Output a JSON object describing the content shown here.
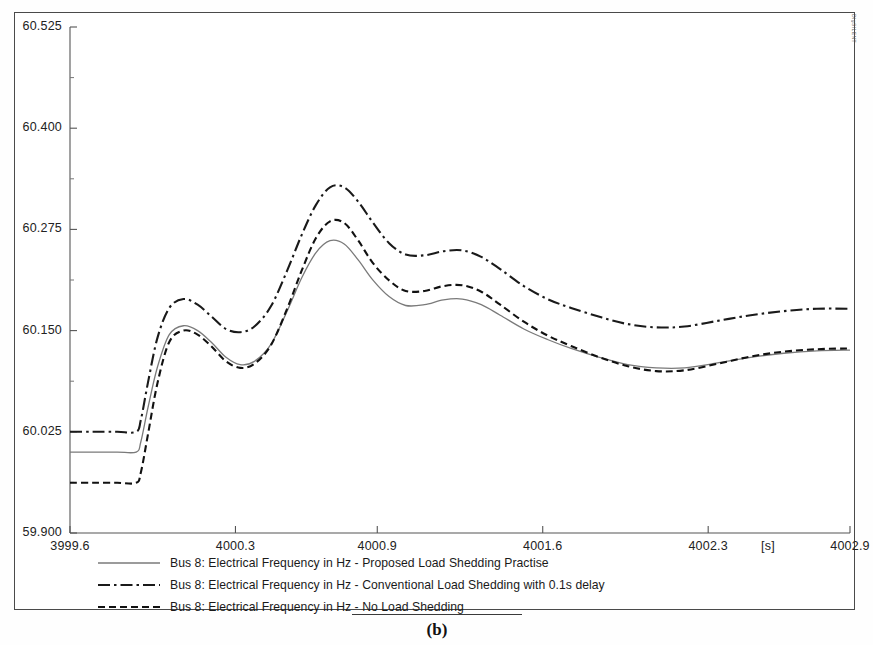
{
  "figure": {
    "caption": "(b)",
    "watermark": "DIgSILENT"
  },
  "axes": {
    "y_ticks": [
      "60.525",
      "60.400",
      "60.275",
      "60.150",
      "60.025",
      "59.900"
    ],
    "x_ticks": [
      "3999.6",
      "4000.3",
      "4000.9",
      "4001.6",
      "4002.3",
      "4002.9"
    ],
    "x_unit": "[s]"
  },
  "legend": [
    {
      "key": "solid-line-key",
      "label": "Bus 8: Electrical Frequency in Hz - Proposed Load Shedding Practise"
    },
    {
      "key": "dash-dot-line-key",
      "label": "Bus 8: Electrical Frequency in Hz - Conventional Load Shedding with 0.1s delay"
    },
    {
      "key": "dashed-line-key",
      "label": "Bus 8: Electrical Frequency in Hz - No Load Shedding"
    }
  ],
  "chart_data": {
    "type": "line",
    "title": "",
    "xlabel": "[s]",
    "ylabel": "Electrical Frequency in Hz",
    "xlim": [
      3999.6,
      4002.9
    ],
    "ylim": [
      59.9,
      60.525
    ],
    "grid": false,
    "legend_position": "below-axes",
    "x": [
      3999.6,
      3999.7,
      3999.8,
      3999.88,
      3999.9,
      3999.93,
      3999.97,
      4000.02,
      4000.08,
      4000.14,
      4000.2,
      4000.26,
      4000.32,
      4000.38,
      4000.45,
      4000.52,
      4000.58,
      4000.64,
      4000.7,
      4000.76,
      4000.82,
      4000.88,
      4000.95,
      4001.02,
      4001.1,
      4001.18,
      4001.26,
      4001.34,
      4001.42,
      4001.52,
      4001.62,
      4001.72,
      4001.84,
      4001.96,
      4002.08,
      4002.2,
      4002.34,
      4002.48,
      4002.62,
      4002.76,
      4002.9
    ],
    "series": [
      {
        "name": "Bus 8: Electrical Frequency in Hz - Proposed Load Shedding Practise",
        "style": "solid",
        "color": "#7a7a7a",
        "values": [
          60.0,
          60.0,
          60.0,
          60.0,
          60.013,
          60.055,
          60.105,
          60.145,
          60.156,
          60.15,
          60.135,
          60.117,
          60.108,
          60.112,
          60.133,
          60.175,
          60.215,
          60.246,
          60.261,
          60.257,
          60.237,
          60.213,
          60.192,
          60.181,
          60.182,
          60.188,
          60.189,
          60.182,
          60.169,
          60.152,
          60.139,
          60.128,
          60.117,
          60.108,
          60.104,
          60.104,
          60.11,
          60.117,
          60.122,
          60.125,
          60.126
        ]
      },
      {
        "name": "Bus 8: Electrical Frequency in Hz - Conventional Load Shedding with 0.1s delay",
        "style": "dash-dot",
        "color": "#1a1a1a",
        "values": [
          60.025,
          60.025,
          60.025,
          60.025,
          60.04,
          60.086,
          60.141,
          60.178,
          60.189,
          60.182,
          60.167,
          60.152,
          60.148,
          60.155,
          60.18,
          60.225,
          60.268,
          60.305,
          60.327,
          60.327,
          60.309,
          60.284,
          60.258,
          60.244,
          60.243,
          60.248,
          60.249,
          60.241,
          60.226,
          60.205,
          60.189,
          60.178,
          60.167,
          60.158,
          60.154,
          60.155,
          60.162,
          60.169,
          60.174,
          60.177,
          60.177
        ]
      },
      {
        "name": "Bus 8: Electrical Frequency in Hz - No Load Shedding",
        "style": "dashed",
        "color": "#111111",
        "values": [
          59.962,
          59.962,
          59.962,
          59.962,
          59.975,
          60.022,
          60.085,
          60.136,
          60.15,
          60.145,
          60.13,
          60.112,
          60.104,
          60.109,
          60.132,
          60.178,
          60.224,
          60.264,
          60.285,
          60.283,
          60.261,
          60.234,
          60.212,
          60.199,
          60.199,
          60.205,
          60.206,
          60.198,
          60.182,
          60.161,
          60.144,
          60.131,
          60.117,
          60.106,
          60.1,
          60.101,
          60.109,
          60.118,
          60.124,
          60.127,
          60.128
        ]
      }
    ]
  }
}
